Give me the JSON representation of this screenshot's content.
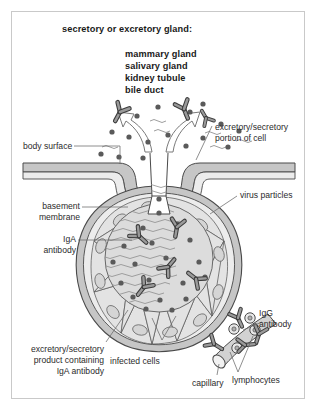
{
  "figure": {
    "title": "secretory or excretory gland:",
    "gland_examples": [
      "mammary gland",
      "salivary gland",
      "kidney tubule",
      "bile duct"
    ],
    "labels": {
      "body_surface": "body surface",
      "basement_membrane_l1": "basement",
      "basement_membrane_l2": "membrane",
      "iga_antibody_l1": "IgA",
      "iga_antibody_l2": "antibody",
      "excretory_portion_l1": "excretory/secretory",
      "excretory_portion_l2": "portion of cell",
      "virus_particles": "virus particles",
      "igg_antibody_l1": "IgG",
      "igg_antibody_l2": "antibody",
      "product_l1": "excretory/secretory",
      "product_l2": "product containing",
      "product_l3": "IgA antibody",
      "infected_cells": "infected cells",
      "capillary": "capillary",
      "lymphocytes": "lymphocytes"
    },
    "colors": {
      "frame_border": "#c9c9c9",
      "outline": "#4a4a4a",
      "cell_fill": "#e3e3e3",
      "lumen_fill": "#dcdcdc",
      "surface_band": "#c6c6c6",
      "virus_particle": "#5a5a5a",
      "antibody_fill": "#9a9a9a",
      "capillary_fill": "#d2d2d2",
      "text": "#2b2b2b"
    },
    "counts": {
      "epithelial_cells": 14,
      "lymphocytes": 4
    }
  }
}
